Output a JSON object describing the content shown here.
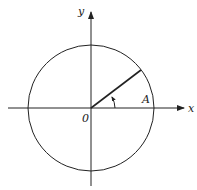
{
  "diagram": {
    "type": "unit-circle",
    "labels": {
      "x_axis": "x",
      "y_axis": "y",
      "origin": "0",
      "point": "A"
    },
    "colors": {
      "stroke": "#222222",
      "background": "#ffffff"
    }
  }
}
